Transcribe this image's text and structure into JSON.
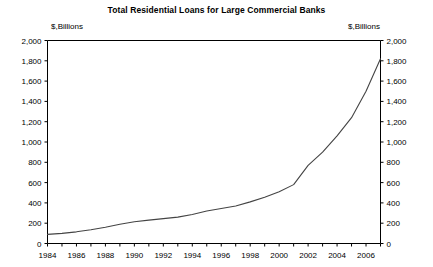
{
  "chart_data": {
    "type": "line",
    "title": "Total Residential Loans for Large Commercial Banks",
    "xlabel": "",
    "ylabel": "$,Billions",
    "ylabel_right": "$,Billions",
    "ylim": [
      0,
      2000
    ],
    "xlim": [
      1984,
      2007
    ],
    "yticks": [
      0,
      200,
      400,
      600,
      800,
      1000,
      1200,
      1400,
      1600,
      1800,
      2000
    ],
    "ytick_labels": [
      "0",
      "200",
      "400",
      "600",
      "800",
      "1,000",
      "1,200",
      "1,400",
      "1,600",
      "1,800",
      "2,000"
    ],
    "xticks": [
      1984,
      1986,
      1988,
      1990,
      1992,
      1994,
      1996,
      1998,
      2000,
      2002,
      2004,
      2006
    ],
    "xtick_labels": [
      "1984",
      "1986",
      "1988",
      "1990",
      "1992",
      "1994",
      "1996",
      "1998",
      "2000",
      "2002",
      "2004",
      "2006"
    ],
    "grid": false,
    "legend": null,
    "axis_right": true,
    "line_color": "#444444",
    "series": [
      {
        "name": "Total Residential Loans",
        "x": [
          1984,
          1985,
          1986,
          1987,
          1988,
          1989,
          1990,
          1991,
          1992,
          1993,
          1994,
          1995,
          1996,
          1997,
          1998,
          1999,
          2000,
          2001,
          2002,
          2003,
          2004,
          2005,
          2006,
          2007
        ],
        "values": [
          90,
          100,
          115,
          135,
          160,
          190,
          215,
          230,
          245,
          260,
          285,
          320,
          345,
          370,
          410,
          455,
          510,
          580,
          770,
          900,
          1060,
          1240,
          1500,
          1820
        ]
      }
    ]
  }
}
